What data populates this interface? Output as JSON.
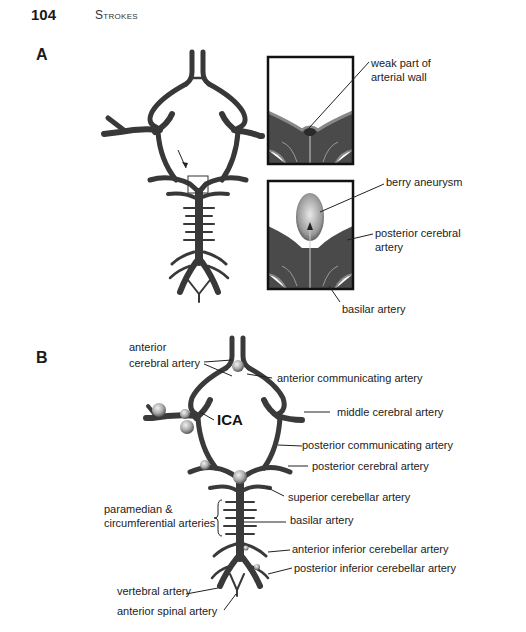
{
  "header": {
    "page_number": "104",
    "running_head": "Strokes"
  },
  "panel_a": {
    "label": "A",
    "inset_top_labels": [
      "weak part of",
      "arterial wall"
    ],
    "inset_bottom_labels": {
      "aneurysm": "berry aneurysm",
      "pca_line1": "posterior cerebral",
      "pca_line2": "artery",
      "basilar": "basilar artery"
    }
  },
  "panel_b": {
    "label": "B",
    "ica": "ICA",
    "labels": {
      "aca_line1": "anterior",
      "aca_line2": "cerebral artery",
      "acom": "anterior communicating artery",
      "mca": "middle cerebral artery",
      "pcom": "posterior communicating artery",
      "pca": "posterior cerebral artery",
      "sca": "superior cerebellar artery",
      "basilar": "basilar  artery",
      "para_line1": "paramedian &",
      "para_line2": "circumferential arteries",
      "aica": "anterior inferior cerebellar artery",
      "pica": "posterior inferior cerebellar artery",
      "vertebral": "vertebral artery",
      "spinal": "anterior spinal artery"
    }
  },
  "colors": {
    "artery": "#3c3c3c",
    "artery_edge": "#1e1e1e",
    "aneurysm": "#b8b8b8",
    "leader": "#222222"
  }
}
